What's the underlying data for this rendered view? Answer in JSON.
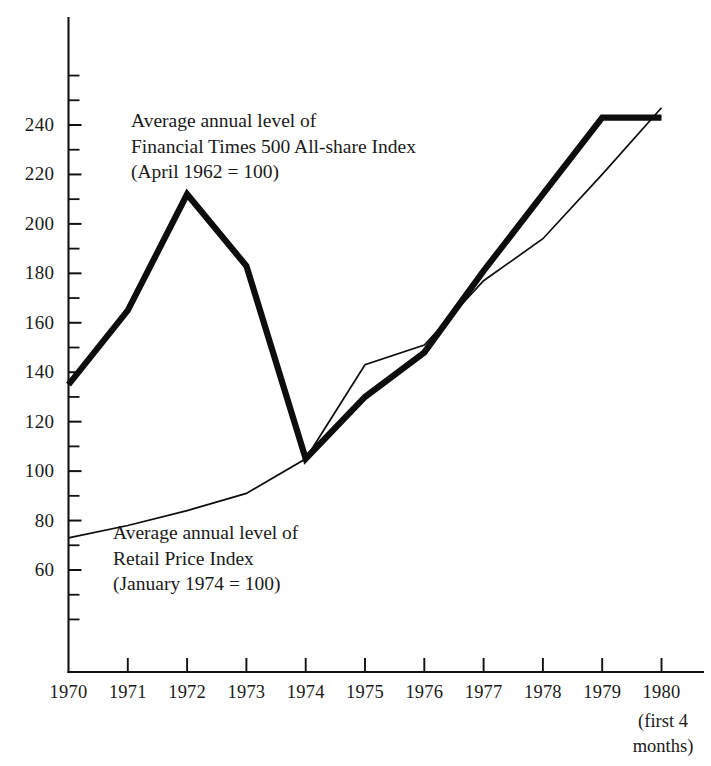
{
  "chart_data": {
    "type": "line",
    "title": "",
    "xlabel": "",
    "ylabel": "",
    "grid": false,
    "legend_position": "inline-annotations",
    "x": [
      1970,
      1971,
      1972,
      1973,
      1974,
      1975,
      1976,
      1977,
      1978,
      1979,
      1980
    ],
    "categories": [
      "1970",
      "1971",
      "1972",
      "1973",
      "1974",
      "1975",
      "1976",
      "1977",
      "1978",
      "1979",
      "1980"
    ],
    "xlim": [
      1970,
      1980
    ],
    "ylim": [
      40,
      260
    ],
    "y_major_ticks": [
      60,
      80,
      100,
      120,
      140,
      160,
      180,
      200,
      220,
      240
    ],
    "y_major_tick_labels": [
      "60",
      "80",
      "100",
      "120",
      "140",
      "160",
      "180",
      "200",
      "220",
      "240"
    ],
    "y_minor_tick_interval": 10,
    "series": [
      {
        "name": "Average annual level of Financial Times 500 All-share Index (April 1962 = 100)",
        "style": "thick",
        "values": [
          135,
          165,
          212,
          183,
          105,
          130,
          148,
          181,
          212,
          243,
          243
        ]
      },
      {
        "name": "Average annual level of Retail Price Index (January 1974 = 100)",
        "style": "thin",
        "values": [
          73,
          78,
          84,
          91,
          105,
          143,
          151,
          177,
          194,
          220,
          247
        ]
      }
    ],
    "annotations": [
      {
        "id": "ft-index-label",
        "lines": [
          "Average annual level of",
          "Financial Times 500 All-share Index",
          "(April 1962 = 100)"
        ]
      },
      {
        "id": "rpi-label",
        "lines": [
          "Average annual level of",
          "Retail Price Index",
          "(January 1974 = 100)"
        ]
      }
    ],
    "x_axis_note": [
      "(first 4",
      "months)"
    ]
  },
  "colors": {
    "ink": "#0d0d0d",
    "background": "#ffffff"
  }
}
